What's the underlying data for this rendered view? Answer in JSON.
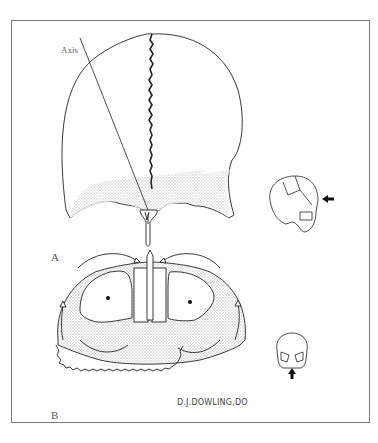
{
  "figure": {
    "panels": [
      {
        "label": "A",
        "description": "Posterior-superior view of skull vault showing sagittal suture, skull axis line and nasal/vomer process; inset lateral skull with arrow indicating view direction"
      },
      {
        "label": "B",
        "description": "Inferior/anterior view of facial skeleton showing nasal cavity, maxillary sinuses with dots, and curved arrows indicating motion; inset frontal skull with upward arrow"
      }
    ],
    "annotations": {
      "axis_label": "Axis",
      "panel_a_label": "A",
      "panel_b_label": "B",
      "signature": "D.J.DOWLING,DO"
    },
    "icons": {
      "lateral_skull_inset": "lateral-skull-icon",
      "frontal_skull_inset": "frontal-skull-icon",
      "view_arrow_left": "arrow-left-icon",
      "view_arrow_up": "arrow-up-icon"
    },
    "colors": {
      "line": "#222222",
      "shading": "#cfcfcf",
      "frame": "#7a7a7a",
      "background": "#ffffff"
    }
  }
}
